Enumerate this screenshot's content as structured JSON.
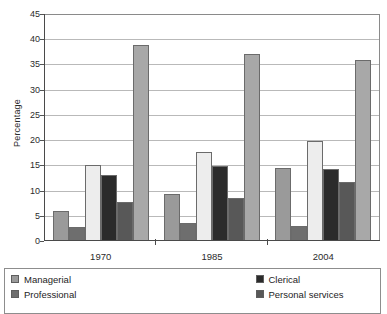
{
  "chart_data": {
    "type": "bar",
    "title": "",
    "xlabel": "",
    "ylabel": "Percentage",
    "ylim": [
      0,
      45
    ],
    "ytick_step": 5,
    "yticks": [
      "45",
      "40",
      "35",
      "30",
      "25",
      "20",
      "15",
      "10",
      "5",
      "0"
    ],
    "grid": true,
    "legend_position": "bottom",
    "categories": [
      "1970",
      "1985",
      "2004"
    ],
    "series": [
      {
        "name": "Managerial",
        "color": "#9a9a9a",
        "values": [
          5.8,
          9.2,
          14.3
        ]
      },
      {
        "name": "Professional",
        "color": "#6e6e6e",
        "values": [
          2.6,
          3.4,
          2.8
        ]
      },
      {
        "name": "Clerical",
        "color": "#ededed",
        "values": [
          14.8,
          17.4,
          19.6
        ]
      },
      {
        "name": "Personal services",
        "color": "#2b2b2b",
        "values": [
          12.9,
          14.7,
          14.0
        ]
      },
      {
        "name": "Sales",
        "color": "#585858",
        "values": [
          7.5,
          8.4,
          11.5
        ]
      },
      {
        "name": "Other",
        "color": "#a8a8a8",
        "values": [
          38.7,
          36.9,
          35.6
        ]
      }
    ]
  },
  "legend": {
    "items": [
      {
        "label": "Managerial",
        "color": "#9a9a9a"
      },
      {
        "label": "Clerical",
        "color": "#2b2b2b"
      },
      {
        "label": "Professional",
        "color": "#6e6e6e"
      },
      {
        "label": "Personal services",
        "color": "#585858"
      }
    ]
  }
}
